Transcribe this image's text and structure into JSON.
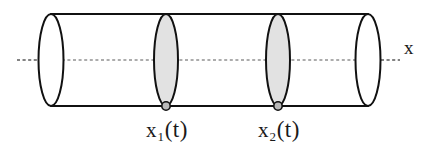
{
  "figure": {
    "type": "technical-diagram",
    "background_color": "#ffffff",
    "outline_color": "#111111",
    "cross_section_fill": "#e2e2e2",
    "axis_color": "#5a5a5a",
    "marker_fill": "#b9b9b9",
    "axis": {
      "label": "x",
      "label_x": 408,
      "label_y": 48,
      "line_y": 60,
      "line_start_x": 17,
      "line_end_x": 400,
      "style": "dashed"
    },
    "cylinder": {
      "top_y": 14,
      "bottom_y": 106,
      "left_center_x": 51,
      "right_center_x": 368,
      "cap_rx": 12.5,
      "cap_ry": 46
    },
    "cross_sections": [
      {
        "id": "cross-section-1",
        "label": "x",
        "subscript": "1",
        "argument": "(t)",
        "center_x": 166,
        "center_y": 60,
        "rx": 12,
        "ry": 46,
        "filled": true,
        "marker_x": 166,
        "marker_y": 106
      },
      {
        "id": "cross-section-2",
        "label": "x",
        "subscript": "2",
        "argument": "(t)",
        "center_x": 278,
        "center_y": 60,
        "rx": 12,
        "ry": 46,
        "filled": true,
        "marker_x": 278,
        "marker_y": 106
      }
    ]
  }
}
